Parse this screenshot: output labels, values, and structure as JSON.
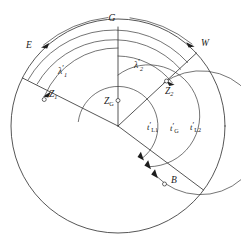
{
  "figure": {
    "background_color": "#ffffff",
    "line_color": "#2b2b2b",
    "center": {
      "x": 118,
      "y": 126
    },
    "outer_radius": 107
  },
  "labels": {
    "greenwich": "G",
    "east": "E",
    "west": "W",
    "zenith_greenwich": {
      "base": "Z",
      "sub": "G"
    },
    "zenith_one": {
      "base": "Z",
      "sub": "1"
    },
    "zenith_two": {
      "base": "Z",
      "sub": "2"
    },
    "body": "B",
    "lambda_one": {
      "base": "λ",
      "sub": "1",
      "prime": "′"
    },
    "lambda_two": {
      "base": "λ",
      "sub": "2",
      "prime": "′"
    },
    "t_l1": {
      "base": "t",
      "prime": "′",
      "sub": "L1"
    },
    "t_g": {
      "base": "t",
      "prime": "′",
      "sub": "G"
    },
    "t_l2": {
      "base": "t",
      "prime": "′",
      "sub": "L2"
    }
  },
  "elements": {
    "outer_circle": "celestial-horizon-circle",
    "g_meridian": "greenwich-meridian-line",
    "z1_ray": "observer-1-meridian-line",
    "z2_ray": "observer-2-meridian-line",
    "b_ray": "body-hour-circle-line",
    "lambda1_arc": "longitude-1-arc",
    "lambda2_arc": "longitude-2-arc",
    "t_l1_arc": "local-hour-angle-1-arc",
    "t_g_arc": "greenwich-hour-angle-arc",
    "t_l2_arc": "local-hour-angle-2-arc",
    "direction_arc": "east-west-direction-arc"
  },
  "markers": [
    {
      "name": "z1-marker",
      "label": "Z1"
    },
    {
      "name": "z2-marker",
      "label": "Z2"
    },
    {
      "name": "zg-marker",
      "label": "ZG"
    },
    {
      "name": "b-marker",
      "label": "B"
    }
  ]
}
